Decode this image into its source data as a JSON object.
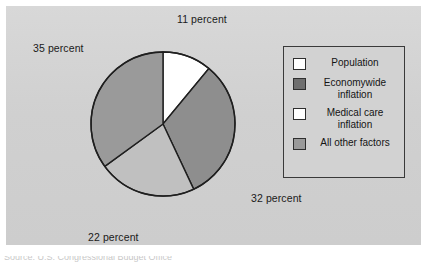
{
  "chart_data": {
    "type": "pie",
    "title": "",
    "subtitle": "",
    "xlabel": "",
    "ylabel": "",
    "legend_position": "right",
    "grid": false,
    "start_angle_deg": 0,
    "direction": "clockwise",
    "categories": [
      "Population",
      "Economywide inflation",
      "Medical care inflation",
      "All other factors"
    ],
    "values": [
      11,
      32,
      22,
      35
    ],
    "value_unit": "percent",
    "slices": [
      {
        "label": "Population",
        "value": 11,
        "annotation": "11 percent",
        "color": "#ffffff"
      },
      {
        "label": "Economywide inflation",
        "value": 32,
        "annotation": "32 percent",
        "color": "#8e8e8e"
      },
      {
        "label": "Medical care inflation",
        "value": 22,
        "annotation": "22 percent",
        "color": "#c0c0c0"
      },
      {
        "label": "All other factors",
        "value": 35,
        "annotation": "35 percent",
        "color": "#9a9a9a"
      }
    ],
    "annotations": [
      "11 percent",
      "32 percent",
      "22 percent",
      "35 percent"
    ]
  },
  "pie": {
    "center_x": 163,
    "center_y": 124,
    "radius": 72,
    "outline_color": "#1f1f1f",
    "outline_width": 1.4
  },
  "labels": {
    "top": "11 percent",
    "right": "32 percent",
    "bottom": "22 percent",
    "left": "35 percent"
  },
  "legend": {
    "items": [
      {
        "swatch_color": "#ffffff",
        "line1": "Population",
        "line2": ""
      },
      {
        "swatch_color": "#6f6f6f",
        "line1": "Economywide",
        "line2": "inflation"
      },
      {
        "swatch_color": "#ffffff",
        "line1": "Medical care",
        "line2": "inflation"
      },
      {
        "swatch_color": "#9a9a9a",
        "line1": "All other factors",
        "line2": ""
      }
    ]
  },
  "panel": {
    "background": "#d2d2d2"
  },
  "caption": {
    "text": "Source:  U.S. Congressional Budget Office"
  }
}
